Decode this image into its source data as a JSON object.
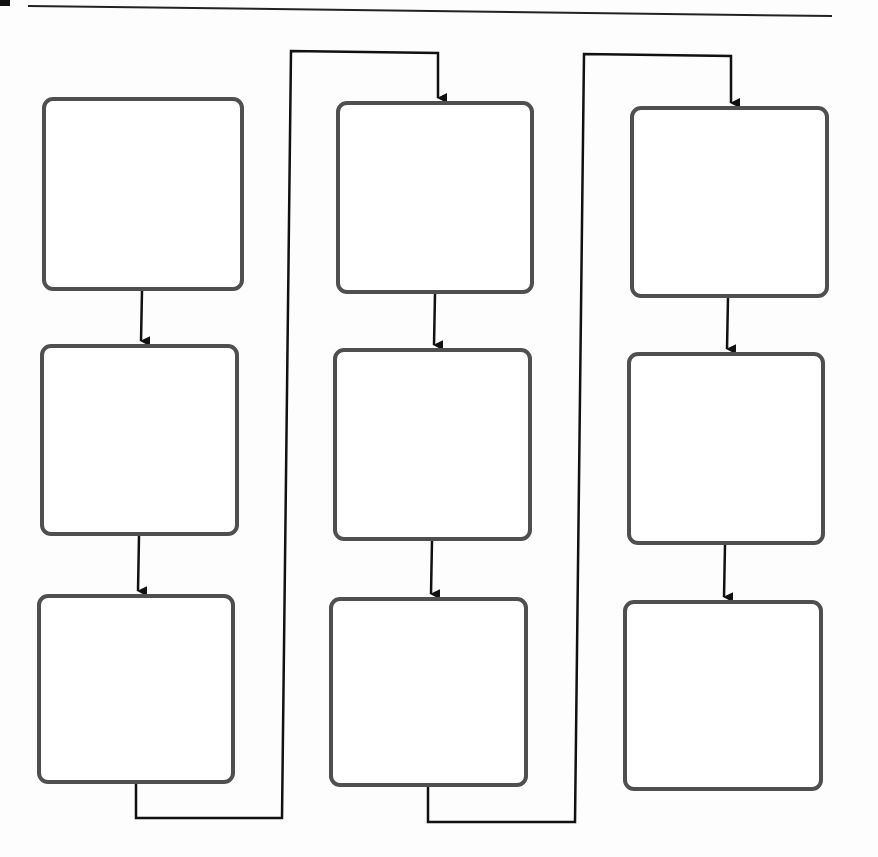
{
  "diagram": {
    "type": "flowchart",
    "colors": {
      "box_border": "#4f4f4f",
      "connector": "#111111",
      "background": "#fdfdfd"
    },
    "columns": [
      {
        "boxes": [
          {
            "id": "box-1",
            "label": "",
            "x": 42,
            "y": 97,
            "w": 202,
            "h": 194
          },
          {
            "id": "box-2",
            "label": "",
            "x": 40,
            "y": 344,
            "w": 199,
            "h": 192
          },
          {
            "id": "box-3",
            "label": "",
            "x": 37,
            "y": 594,
            "w": 198,
            "h": 190
          }
        ]
      },
      {
        "boxes": [
          {
            "id": "box-4",
            "label": "",
            "x": 336,
            "y": 101,
            "w": 198,
            "h": 193
          },
          {
            "id": "box-5",
            "label": "",
            "x": 333,
            "y": 348,
            "w": 199,
            "h": 193
          },
          {
            "id": "box-6",
            "label": "",
            "x": 329,
            "y": 597,
            "w": 199,
            "h": 190
          }
        ]
      },
      {
        "boxes": [
          {
            "id": "box-7",
            "label": "",
            "x": 630,
            "y": 106,
            "w": 199,
            "h": 192
          },
          {
            "id": "box-8",
            "label": "",
            "x": 627,
            "y": 352,
            "w": 198,
            "h": 193
          },
          {
            "id": "box-9",
            "label": "",
            "x": 623,
            "y": 600,
            "w": 200,
            "h": 191
          }
        ]
      }
    ],
    "flow_order": [
      "box-1",
      "box-2",
      "box-3",
      "box-4",
      "box-5",
      "box-6",
      "box-7",
      "box-8",
      "box-9"
    ]
  }
}
